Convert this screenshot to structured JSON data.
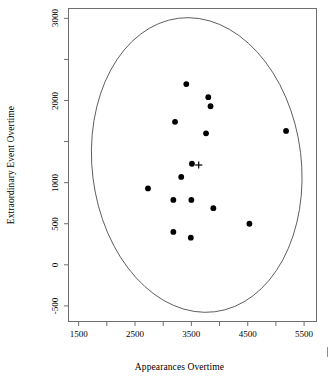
{
  "chart_data": {
    "type": "scatter",
    "title": "",
    "subtitle": "",
    "xlabel": "Appearances Overtime",
    "ylabel": "Extraordinary Event Overtime",
    "xlim": [
      1320,
      5720
    ],
    "ylim": [
      -690,
      3120
    ],
    "xticks": [
      1500,
      2000,
      2500,
      3000,
      3500,
      4000,
      4500,
      5000,
      5500
    ],
    "xtick_labels": [
      "1500",
      "",
      "2500",
      "",
      "3500",
      "",
      "4500",
      "",
      "5500"
    ],
    "yticks": [
      -500,
      0,
      500,
      1000,
      1500,
      2000,
      2500,
      3000
    ],
    "ytick_labels": [
      "-500",
      "0",
      "500",
      "1000",
      "",
      "2000",
      "",
      "3000"
    ],
    "grid": false,
    "legend": "none",
    "series": [
      {
        "name": "observations",
        "marker": "filled-circle",
        "color": "#000000",
        "points": [
          {
            "x": 3410,
            "y": 2200
          },
          {
            "x": 3800,
            "y": 2040
          },
          {
            "x": 3840,
            "y": 1930
          },
          {
            "x": 3210,
            "y": 1740
          },
          {
            "x": 3760,
            "y": 1600
          },
          {
            "x": 5180,
            "y": 1630
          },
          {
            "x": 3510,
            "y": 1230
          },
          {
            "x": 3320,
            "y": 1070
          },
          {
            "x": 2730,
            "y": 930
          },
          {
            "x": 3180,
            "y": 790
          },
          {
            "x": 3500,
            "y": 790
          },
          {
            "x": 3890,
            "y": 690
          },
          {
            "x": 4530,
            "y": 500
          },
          {
            "x": 3180,
            "y": 400
          },
          {
            "x": 3490,
            "y": 330
          }
        ]
      },
      {
        "name": "centroid",
        "marker": "plus",
        "color": "#000000",
        "points": [
          {
            "x": 3630,
            "y": 1215
          }
        ]
      }
    ],
    "ellipse": {
      "name": "confidence-ellipse",
      "center_x": 3595,
      "center_y": 1215,
      "semi_axis_x": 1855,
      "semi_axis_y": 1800,
      "rotation_deg": -7,
      "color": "#555555"
    }
  },
  "axes": {
    "x_title": "Appearances Overtime",
    "y_title": "Extraordinary Event Overtime"
  }
}
